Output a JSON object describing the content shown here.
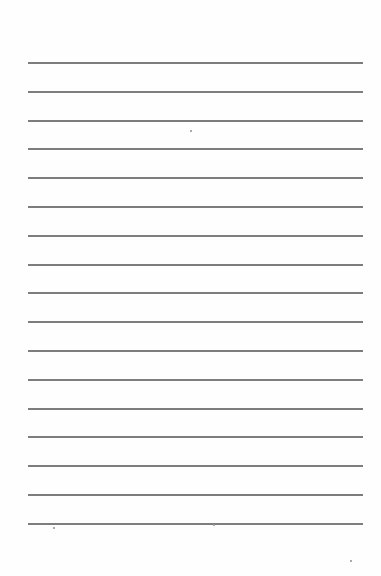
{
  "page": {
    "type": "lined-paper",
    "background_color": "#fefefe",
    "line_color": "#7d7d7d",
    "line_count": 17,
    "line_left": 28,
    "line_right": 363,
    "first_line_y": 62,
    "line_spacing": 28.8
  },
  "lines": [
    {
      "y": 62
    },
    {
      "y": 91
    },
    {
      "y": 120
    },
    {
      "y": 148
    },
    {
      "y": 177
    },
    {
      "y": 206
    },
    {
      "y": 235
    },
    {
      "y": 264
    },
    {
      "y": 292
    },
    {
      "y": 321
    },
    {
      "y": 350
    },
    {
      "y": 379
    },
    {
      "y": 408
    },
    {
      "y": 436
    },
    {
      "y": 465
    },
    {
      "y": 494
    },
    {
      "y": 523
    }
  ],
  "specks": [
    {
      "x": 53,
      "y": 527
    },
    {
      "x": 213,
      "y": 524
    },
    {
      "x": 350,
      "y": 560
    },
    {
      "x": 190,
      "y": 130
    }
  ]
}
